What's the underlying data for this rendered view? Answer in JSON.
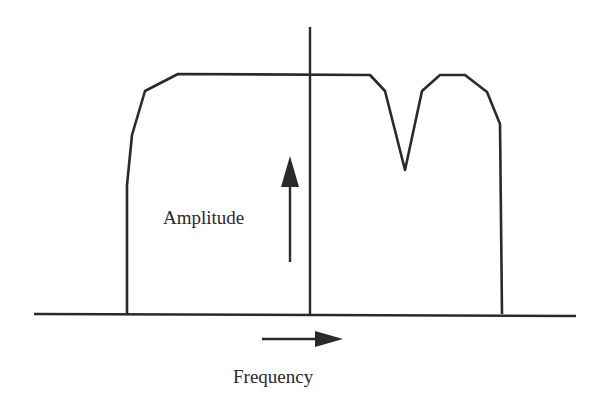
{
  "diagram": {
    "title": "",
    "colors": {
      "stroke": "#2a2a2a",
      "background": "#ffffff"
    },
    "labels": {
      "amplitude": "Amplitude",
      "frequency": "Frequency"
    },
    "elements": {
      "frequency_axis": "horizontal baseline",
      "center_line": "vertical center line",
      "spectrum_curve": "flat-top passband with notch on right side",
      "amplitude_arrow": "upward arrow",
      "frequency_arrow": "rightward arrow"
    }
  }
}
